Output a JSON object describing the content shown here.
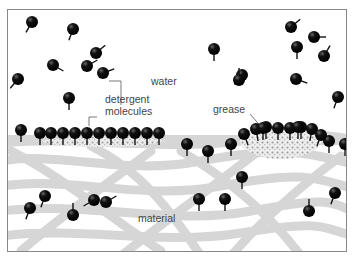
{
  "diagram": {
    "labels": {
      "water": "water",
      "detergent_line1": "detergent",
      "detergent_line2": "molecules",
      "grease": "grease",
      "material": "material"
    },
    "colors": {
      "molecule": "#111111",
      "fibre": "#d4d4d4",
      "grease": "#e6e6e6",
      "frame": "#888888"
    },
    "free_molecules_in_water": [
      [
        31,
        21,
        120
      ],
      [
        72,
        28,
        110
      ],
      [
        95,
        52,
        -40
      ],
      [
        52,
        64,
        30
      ],
      [
        86,
        65,
        -30
      ],
      [
        102,
        72,
        -20
      ],
      [
        17,
        78,
        130
      ],
      [
        68,
        97,
        90
      ],
      [
        213,
        48,
        90
      ],
      [
        241,
        74,
        130
      ],
      [
        290,
        26,
        -40
      ],
      [
        313,
        36,
        0
      ],
      [
        296,
        46,
        90
      ],
      [
        323,
        55,
        -60
      ],
      [
        238,
        79,
        -90
      ],
      [
        295,
        78,
        20
      ],
      [
        337,
        96,
        110
      ]
    ],
    "free_molecules_in_material": [
      [
        29,
        207,
        110
      ],
      [
        44,
        195,
        110
      ],
      [
        72,
        214,
        -90
      ],
      [
        93,
        199,
        150
      ],
      [
        105,
        201,
        -30
      ],
      [
        198,
        198,
        90
      ],
      [
        224,
        198,
        90
      ],
      [
        241,
        176,
        90
      ],
      [
        308,
        210,
        -90
      ],
      [
        334,
        192,
        110
      ]
    ]
  }
}
